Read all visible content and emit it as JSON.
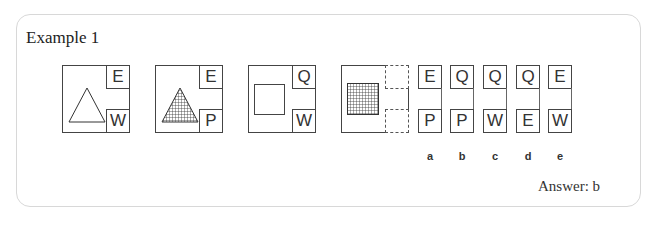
{
  "title": "Example 1",
  "answer": "Answer: b",
  "figures": [
    {
      "shape": "triangle-outline",
      "top": "E",
      "bottom": "W"
    },
    {
      "shape": "triangle-hatched",
      "top": "E",
      "bottom": "P"
    },
    {
      "shape": "square-outline",
      "top": "Q",
      "bottom": "W"
    },
    {
      "shape": "square-hatched",
      "top": "",
      "bottom": ""
    }
  ],
  "options": [
    {
      "label": "a",
      "top": "E",
      "bottom": "P"
    },
    {
      "label": "b",
      "top": "Q",
      "bottom": "P"
    },
    {
      "label": "c",
      "top": "Q",
      "bottom": "W"
    },
    {
      "label": "d",
      "top": "Q",
      "bottom": "E"
    },
    {
      "label": "e",
      "top": "E",
      "bottom": "W"
    }
  ]
}
